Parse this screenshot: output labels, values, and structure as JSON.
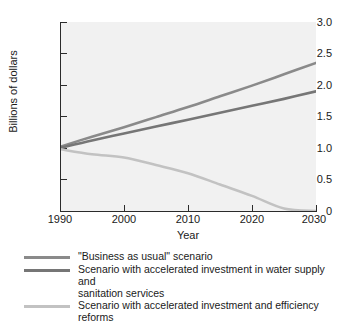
{
  "chart_data": {
    "type": "line",
    "title": "",
    "xlabel": "Year",
    "ylabel": "Billions of dollars",
    "xlim": [
      1990,
      2030
    ],
    "ylim": [
      0,
      3.0
    ],
    "xticks": [
      1990,
      2000,
      2010,
      2020,
      2030
    ],
    "xtick_labels": [
      "1990",
      "2000",
      "2010",
      "2020",
      "2030"
    ],
    "yticks": [
      0,
      0.5,
      1.0,
      1.5,
      2.0,
      2.5,
      3.0
    ],
    "ytick_labels": [
      "0",
      "0.5",
      "1.0",
      "1.5",
      "2.0",
      "2.5",
      "3.0"
    ],
    "grid": false,
    "legend_position": "below",
    "plot_background": "#f1f1f1",
    "x": [
      1990,
      1995,
      2000,
      2005,
      2010,
      2015,
      2020,
      2025,
      2030
    ],
    "series": [
      {
        "name": "\"Business as usual\" scenario",
        "color": "#8a8a8a",
        "values": [
          1.02,
          1.18,
          1.33,
          1.49,
          1.65,
          1.82,
          1.99,
          2.17,
          2.35
        ]
      },
      {
        "name": "Scenario with accelerated investment in water supply and sanitation services",
        "color": "#767676",
        "values": [
          1.0,
          1.12,
          1.23,
          1.34,
          1.45,
          1.56,
          1.67,
          1.78,
          1.9
        ]
      },
      {
        "name": "Scenario with accelerated investment and efficiency reforms",
        "color": "#c2c2c2",
        "values": [
          0.98,
          0.9,
          0.85,
          0.73,
          0.6,
          0.42,
          0.24,
          0.04,
          0.0
        ]
      }
    ]
  },
  "legend": {
    "entries": [
      {
        "label": "\"Business as usual\" scenario",
        "continuation": "",
        "color": "#8a8a8a"
      },
      {
        "label": "Scenario with accelerated investment in water supply and",
        "continuation": "sanitation services",
        "color": "#767676"
      },
      {
        "label": "Scenario with accelerated investment and efficiency reforms",
        "continuation": "",
        "color": "#c2c2c2"
      }
    ]
  },
  "axes": {
    "y_title": "Billions of dollars",
    "x_title": "Year",
    "y_labels": [
      "3.0",
      "2.5",
      "2.0",
      "1.5",
      "1.0",
      "0.5",
      "0"
    ],
    "x_labels": [
      "1990",
      "2000",
      "2010",
      "2020",
      "2030"
    ]
  }
}
